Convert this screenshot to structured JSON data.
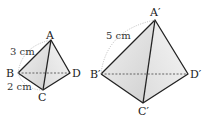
{
  "figure": {
    "small_tetrahedron": {
      "vertices": {
        "A": "A",
        "B": "B",
        "C": "C",
        "D": "D"
      },
      "dimensions": {
        "AB": "3 cm",
        "BC": "2 cm"
      }
    },
    "large_tetrahedron": {
      "vertices": {
        "A": "A′",
        "B": "B′",
        "C": "C′",
        "D": "D′"
      },
      "dimensions": {
        "AB": "5 cm"
      }
    },
    "colors": {
      "edge": "#222222",
      "face_light": "#e6e6e6",
      "face_dark": "#d2d2d2",
      "hidden_edge": "#555555",
      "dimension_arc": "#aaaaaa"
    }
  }
}
